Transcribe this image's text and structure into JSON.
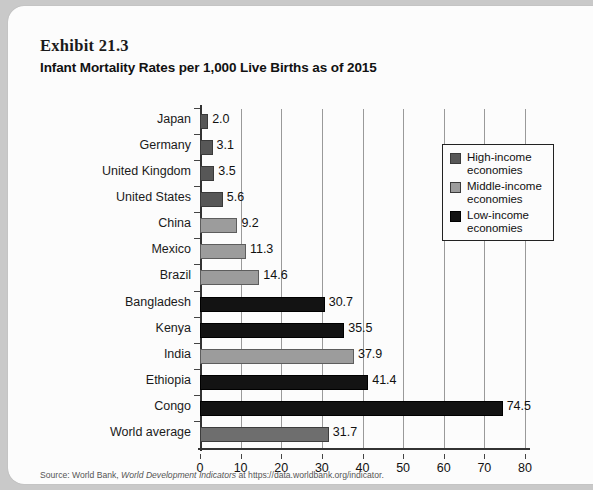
{
  "exhibit": {
    "number": "Exhibit 21.3",
    "title": "Infant Mortality Rates per 1,000 Live Births as of 2015"
  },
  "source": {
    "prefix": "Source: World Bank, ",
    "italic": "World Development Indicators",
    "suffix": " at https://data.worldbank.org/indicator."
  },
  "legend": {
    "items": [
      {
        "label_line1": "High-income",
        "label_line2": "economies",
        "color": "#575757",
        "key": "high"
      },
      {
        "label_line1": "Middle-income",
        "label_line2": "economies",
        "color": "#9c9c9c",
        "key": "middle"
      },
      {
        "label_line1": "Low-income",
        "label_line2": "economies",
        "color": "#131313",
        "key": "low"
      }
    ]
  },
  "chart_data": {
    "type": "bar",
    "orientation": "horizontal",
    "title": "Infant Mortality Rates per 1,000 Live Births as of 2015",
    "xlabel": "",
    "ylabel": "",
    "xlim": [
      0,
      80
    ],
    "xticks": [
      0,
      10,
      20,
      30,
      40,
      50,
      60,
      70,
      80
    ],
    "grid": "vertical",
    "legend_position": "upper-right-inside",
    "categories": [
      "Japan",
      "Germany",
      "United Kingdom",
      "United States",
      "China",
      "Mexico",
      "Brazil",
      "Bangladesh",
      "Kenya",
      "India",
      "Ethiopia",
      "Congo",
      "World average"
    ],
    "values": [
      2.0,
      3.1,
      3.5,
      5.6,
      9.2,
      11.3,
      14.6,
      30.7,
      35.5,
      37.9,
      41.4,
      74.5,
      31.7
    ],
    "value_labels": [
      "2.0",
      "3.1",
      "3.5",
      "5.6",
      "9.2",
      "11.3",
      "14.6",
      "30.7",
      "35.5",
      "37.9",
      "41.4",
      "74.5",
      "31.7"
    ],
    "group": [
      "high",
      "high",
      "high",
      "high",
      "middle",
      "middle",
      "middle",
      "low",
      "low",
      "middle",
      "low",
      "low",
      "world"
    ],
    "series": [
      {
        "name": "High-income economies",
        "color": "#575757",
        "members": [
          "Japan",
          "Germany",
          "United Kingdom",
          "United States"
        ]
      },
      {
        "name": "Middle-income economies",
        "color": "#9c9c9c",
        "members": [
          "China",
          "Mexico",
          "Brazil",
          "India"
        ]
      },
      {
        "name": "Low-income economies",
        "color": "#131313",
        "members": [
          "Bangladesh",
          "Kenya",
          "Ethiopia",
          "Congo"
        ]
      },
      {
        "name": "World average",
        "color": "#6e6e6e",
        "members": [
          "World average"
        ]
      }
    ]
  }
}
